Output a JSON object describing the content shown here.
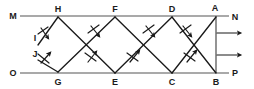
{
  "figure": {
    "type": "ray-reflection-diagram",
    "width": 254,
    "height": 89,
    "colors": {
      "background": "#ffffff",
      "mirror_line": "#8c8c8c",
      "ray": "#1a1a1a",
      "label": "#1a1a1a"
    },
    "mirrors": [
      {
        "name": "top-mirror-MN",
        "x1": 20,
        "y1": 16,
        "x2": 229,
        "y2": 16
      },
      {
        "name": "bottom-mirror-OP",
        "x1": 20,
        "y1": 73,
        "x2": 229,
        "y2": 73
      }
    ],
    "vertical_segment": {
      "name": "segment-AB",
      "x1": 216,
      "y1": 16,
      "x2": 216,
      "y2": 73
    },
    "labels": [
      {
        "id": "M",
        "text": "M",
        "x": 13,
        "y": 16
      },
      {
        "id": "H",
        "text": "H",
        "x": 58,
        "y": 9
      },
      {
        "id": "F",
        "text": "F",
        "x": 115,
        "y": 9
      },
      {
        "id": "D",
        "text": "D",
        "x": 172,
        "y": 9
      },
      {
        "id": "A",
        "text": "A",
        "x": 215,
        "y": 8
      },
      {
        "id": "N",
        "text": "N",
        "x": 235,
        "y": 17
      },
      {
        "id": "I",
        "text": "I",
        "x": 35,
        "y": 38
      },
      {
        "id": "J",
        "text": "J",
        "x": 35,
        "y": 54
      },
      {
        "id": "O",
        "text": "O",
        "x": 13,
        "y": 73
      },
      {
        "id": "G",
        "text": "G",
        "x": 58,
        "y": 82
      },
      {
        "id": "E",
        "text": "E",
        "x": 115,
        "y": 82
      },
      {
        "id": "C",
        "text": "C",
        "x": 172,
        "y": 82
      },
      {
        "id": "B",
        "text": "B",
        "x": 216,
        "y": 82
      },
      {
        "id": "P",
        "text": "P",
        "x": 235,
        "y": 73
      }
    ],
    "rays": [
      {
        "name": "ray-I-to-H",
        "x1": 38,
        "y1": 45,
        "x2": 58,
        "y2": 17,
        "arrow": "down-right",
        "tick": true
      },
      {
        "name": "ray-H-to-E",
        "x1": 58,
        "y1": 17,
        "x2": 115,
        "y2": 73,
        "arrow": "down-right",
        "tick": true
      },
      {
        "name": "ray-E-to-D",
        "x1": 115,
        "y1": 73,
        "x2": 172,
        "y2": 17,
        "arrow": "up-right",
        "tick": true
      },
      {
        "name": "ray-D-to-B",
        "x1": 172,
        "y1": 17,
        "x2": 216,
        "y2": 73,
        "arrow": "down-right",
        "tick": true
      },
      {
        "name": "ray-J-to-G",
        "x1": 38,
        "y1": 60,
        "x2": 58,
        "y2": 72,
        "arrow": "up-right",
        "tick": true
      },
      {
        "name": "ray-G-to-F",
        "x1": 58,
        "y1": 72,
        "x2": 115,
        "y2": 17,
        "arrow": "up-right",
        "tick": true
      },
      {
        "name": "ray-F-to-C",
        "x1": 115,
        "y1": 17,
        "x2": 172,
        "y2": 73,
        "arrow": "down-right",
        "tick": true
      },
      {
        "name": "ray-C-to-A",
        "x1": 172,
        "y1": 73,
        "x2": 216,
        "y2": 17,
        "arrow": "up-right",
        "tick": true
      }
    ],
    "exit_arrows": [
      {
        "name": "exit-arrow-upper",
        "x1": 217,
        "y1": 33,
        "x2": 243,
        "y2": 33
      },
      {
        "name": "exit-arrow-lower",
        "x1": 217,
        "y1": 55,
        "x2": 243,
        "y2": 55
      }
    ]
  }
}
